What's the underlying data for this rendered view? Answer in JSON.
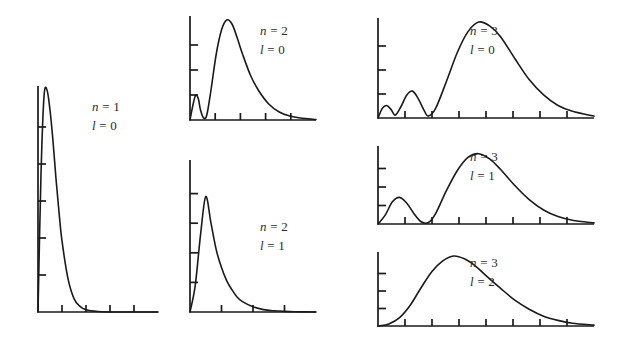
{
  "figure": {
    "curve_color": "#1a1a1a",
    "background_color": "#ffffff"
  },
  "chart_data": {
    "type": "line",
    "title": "",
    "xlabel": "",
    "ylabel": "",
    "grid": false,
    "legend_position": "none",
    "panels": [
      {
        "id": "n1-l0",
        "n_symbol": "n",
        "n_equals": "=",
        "n_value": "1",
        "l_symbol": "l",
        "l_equals": "=",
        "l_value": "0",
        "label_line1": "n = 1",
        "label_line2": "l = 0",
        "peaks": 1,
        "nodes": 0,
        "x_ticks": 4,
        "y_ticks": 5,
        "xlim": [
          0,
          20
        ],
        "ylim": [
          0,
          1
        ],
        "x": [
          0,
          0.5,
          1,
          1.5,
          2,
          2.5,
          3,
          3.5,
          4,
          5,
          6,
          7,
          8,
          10,
          12,
          14,
          16,
          18,
          20
        ],
        "y": [
          0,
          0.62,
          0.97,
          1.0,
          0.91,
          0.77,
          0.6,
          0.45,
          0.32,
          0.15,
          0.06,
          0.025,
          0.01,
          0.002,
          0,
          0,
          0,
          0,
          0
        ]
      },
      {
        "id": "n2-l0",
        "n_symbol": "n",
        "n_equals": "=",
        "n_value": "2",
        "l_symbol": "l",
        "l_equals": "=",
        "l_value": "0",
        "label_line1": "n = 2",
        "label_line2": "l = 0",
        "peaks": 2,
        "nodes": 1,
        "x_ticks": 4,
        "y_ticks": 3,
        "xlim": [
          0,
          24
        ],
        "ylim": [
          0,
          1
        ],
        "x": [
          0,
          0.6,
          1.1,
          1.6,
          2.0,
          2.6,
          3.2,
          4.0,
          5.0,
          6.0,
          7.0,
          8.0,
          9.0,
          10.0,
          11.5,
          13.0,
          15.0,
          17.0,
          19.0,
          21.0,
          24.0
        ],
        "y": [
          0,
          0.16,
          0.25,
          0.21,
          0.1,
          0.02,
          0.05,
          0.3,
          0.66,
          0.9,
          1.0,
          0.96,
          0.82,
          0.66,
          0.45,
          0.3,
          0.16,
          0.08,
          0.04,
          0.02,
          0.005
        ]
      },
      {
        "id": "n2-l1",
        "n_symbol": "n",
        "n_equals": "=",
        "n_value": "2",
        "l_symbol": "l",
        "l_equals": "=",
        "l_value": "1",
        "label_line1": "n = 2",
        "label_line2": "l = 1",
        "peaks": 1,
        "nodes": 0,
        "x_ticks": 3,
        "y_ticks": 4,
        "xlim": [
          0,
          24
        ],
        "ylim": [
          0,
          1
        ],
        "x": [
          0,
          1,
          2,
          3,
          4,
          5,
          6,
          7,
          8,
          9,
          10,
          12,
          14,
          16,
          18,
          20,
          24
        ],
        "y": [
          0,
          0.18,
          0.52,
          0.78,
          0.6,
          0.42,
          0.3,
          0.21,
          0.15,
          0.1,
          0.07,
          0.035,
          0.016,
          0.008,
          0.004,
          0.002,
          0
        ]
      },
      {
        "id": "n3-l0",
        "n_symbol": "n",
        "n_equals": "=",
        "n_value": "3",
        "l_symbol": "l",
        "l_equals": "=",
        "l_value": "0",
        "label_line1": "n = 3",
        "label_line2": "l = 0",
        "peaks": 3,
        "nodes": 2,
        "x_ticks": 7,
        "y_ticks": 3,
        "xlim": [
          0,
          30
        ],
        "ylim": [
          0,
          1
        ],
        "x": [
          0,
          0.6,
          1.2,
          1.8,
          2.4,
          3.2,
          4.0,
          4.8,
          5.6,
          6.4,
          7.0,
          8.0,
          9.5,
          11.0,
          12.5,
          14.0,
          15.5,
          17.0,
          19.0,
          21.0,
          23.0,
          25.0,
          27.0,
          30.0
        ],
        "y": [
          0,
          0.1,
          0.13,
          0.09,
          0.03,
          0.12,
          0.24,
          0.28,
          0.2,
          0.08,
          0.02,
          0.1,
          0.38,
          0.68,
          0.9,
          1.0,
          0.96,
          0.85,
          0.62,
          0.4,
          0.24,
          0.13,
          0.07,
          0.02
        ]
      },
      {
        "id": "n3-l1",
        "n_symbol": "n",
        "n_equals": "=",
        "n_value": "3",
        "l_symbol": "l",
        "l_equals": "=",
        "l_value": "1",
        "label_line1": "n = 3",
        "label_line2": "l = 1",
        "peaks": 2,
        "nodes": 1,
        "x_ticks": 7,
        "y_ticks": 3,
        "xlim": [
          0,
          30
        ],
        "ylim": [
          0,
          1
        ],
        "x": [
          0,
          1.0,
          2.0,
          3.0,
          4.0,
          5.0,
          6.0,
          7.0,
          8.0,
          9.5,
          11.0,
          12.5,
          14.0,
          15.5,
          17.0,
          19.0,
          21.0,
          23.0,
          25.0,
          27.0,
          30.0
        ],
        "y": [
          0,
          0.12,
          0.3,
          0.36,
          0.28,
          0.14,
          0.03,
          0.02,
          0.14,
          0.45,
          0.72,
          0.9,
          0.95,
          0.88,
          0.74,
          0.52,
          0.33,
          0.19,
          0.1,
          0.05,
          0.015
        ]
      },
      {
        "id": "n3-l2",
        "n_symbol": "n",
        "n_equals": "=",
        "n_value": "3",
        "l_symbol": "l",
        "l_equals": "=",
        "l_value": "2",
        "label_line1": "n = 3",
        "label_line2": "l = 2",
        "peaks": 1,
        "nodes": 0,
        "x_ticks": 7,
        "y_ticks": 3,
        "xlim": [
          0,
          30
        ],
        "ylim": [
          0,
          1
        ],
        "x": [
          0,
          1.5,
          3.0,
          4.5,
          6.0,
          7.5,
          9.0,
          10.5,
          12.0,
          13.5,
          15.0,
          17.0,
          19.0,
          21.0,
          23.0,
          25.0,
          27.0,
          30.0
        ],
        "y": [
          0,
          0.03,
          0.12,
          0.3,
          0.55,
          0.78,
          0.93,
          1.0,
          0.96,
          0.86,
          0.72,
          0.54,
          0.37,
          0.24,
          0.14,
          0.08,
          0.04,
          0.012
        ]
      }
    ]
  }
}
